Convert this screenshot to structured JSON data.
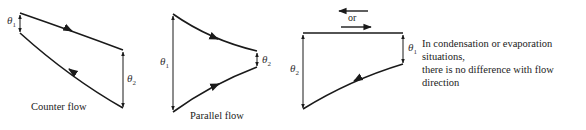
{
  "figure": {
    "panels": [
      {
        "id": "counter-flow",
        "caption": "Counter flow",
        "theta_left": {
          "symbol": "θ",
          "sub": "1"
        },
        "theta_right": {
          "symbol": "θ",
          "sub": "2"
        }
      },
      {
        "id": "parallel-flow",
        "caption": "Parallel flow",
        "theta_left": {
          "symbol": "θ",
          "sub": "1"
        },
        "theta_right": {
          "symbol": "θ",
          "sub": "2"
        }
      },
      {
        "id": "phase-change",
        "direction_label": "or",
        "theta_left": {
          "symbol": "θ",
          "sub": "2"
        },
        "theta_right": {
          "symbol": "θ",
          "sub": "1"
        },
        "note_line1": "In condensation or evaporation situations,",
        "note_line2": "there is no difference with flow direction"
      }
    ],
    "colors": {
      "line": "#1a1a1a",
      "background": "#ffffff"
    }
  }
}
